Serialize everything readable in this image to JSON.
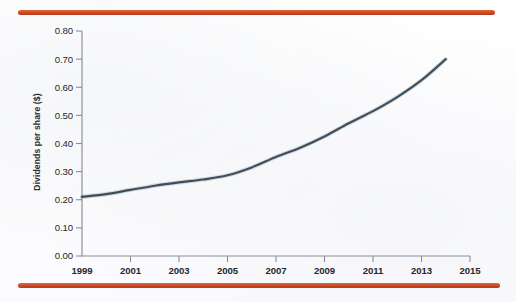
{
  "page": {
    "ghost_text": "                                                                                                  \n                                                                                     \n                                                                                            \n                                                                                   \n                                                                                     \n                                                                              \n                                                                                  ",
    "rule_color": "#cf4c26"
  },
  "chart_data": {
    "type": "line",
    "title": "",
    "xlabel": "",
    "ylabel": "Dividends per share ($)",
    "line_color": "#3d4f5c",
    "grid": false,
    "legend": null,
    "xlim": [
      1999,
      2015
    ],
    "ylim": [
      0.0,
      0.8
    ],
    "x_ticks": [
      "1999",
      "2001",
      "2003",
      "2005",
      "2007",
      "2009",
      "2011",
      "2013",
      "2015"
    ],
    "x_tick_values": [
      1999,
      2001,
      2003,
      2005,
      2007,
      2009,
      2011,
      2013,
      2015
    ],
    "y_ticks": [
      "0.00",
      "0.10",
      "0.20",
      "0.30",
      "0.40",
      "0.50",
      "0.60",
      "0.70",
      "0.80"
    ],
    "y_tick_values": [
      0.0,
      0.1,
      0.2,
      0.3,
      0.4,
      0.5,
      0.6,
      0.7,
      0.8
    ],
    "x": [
      1999,
      2000,
      2001,
      2002,
      2003,
      2004,
      2005,
      2006,
      2007,
      2008,
      2009,
      2010,
      2011,
      2012,
      2013,
      2014
    ],
    "values": [
      0.21,
      0.22,
      0.235,
      0.25,
      0.262,
      0.272,
      0.287,
      0.315,
      0.352,
      0.385,
      0.425,
      0.472,
      0.515,
      0.565,
      0.625,
      0.7
    ]
  }
}
